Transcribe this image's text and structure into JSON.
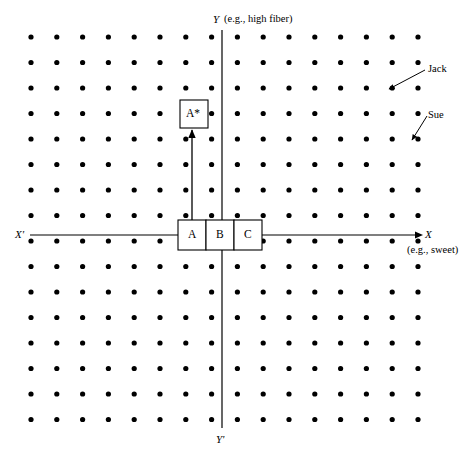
{
  "figure": {
    "kind": "perceptual-map-diagram",
    "width": 474,
    "height": 456,
    "background_color": "#ffffff",
    "ink_color": "#000000"
  },
  "axes": {
    "y_positive_label": "Y",
    "y_positive_note": "(e.g., high fiber)",
    "y_negative_label": "Y'",
    "x_negative_label": "X'",
    "x_positive_label": "X",
    "x_positive_note": "(e.g., sweet)",
    "vertical_axis_x": 222,
    "horizontal_axis_y": 235,
    "vertical_axis_top": 30,
    "vertical_axis_bottom": 428,
    "horizontal_axis_left": 30,
    "horizontal_axis_right": 420
  },
  "grid": {
    "origin_x": 31,
    "origin_y": 37,
    "step_x": 25.8,
    "step_y": 25.5,
    "cols": 16,
    "rows": 16,
    "dot_radius": 2.6
  },
  "brand_boxes": {
    "row_label": "current brands",
    "left": 178,
    "top": 220,
    "cell_width": 28,
    "height": 30,
    "cells": [
      {
        "label": "A"
      },
      {
        "label": "B"
      },
      {
        "label": "C"
      }
    ]
  },
  "target_box": {
    "label": "A*",
    "left": 180,
    "top": 100,
    "width": 28,
    "height": 28
  },
  "reposition_arrow": {
    "from_x": 192,
    "from_y": 220,
    "to_x": 192,
    "to_y": 130
  },
  "callouts": [
    {
      "label": "Jack",
      "text_x": 428,
      "text_y": 64,
      "arrow_from_x": 425,
      "arrow_from_y": 70,
      "arrow_to_x": 389,
      "arrow_to_y": 89
    },
    {
      "label": "Sue",
      "text_x": 428,
      "text_y": 110,
      "arrow_from_x": 427,
      "arrow_from_y": 116,
      "arrow_to_x": 412,
      "arrow_to_y": 140
    }
  ]
}
